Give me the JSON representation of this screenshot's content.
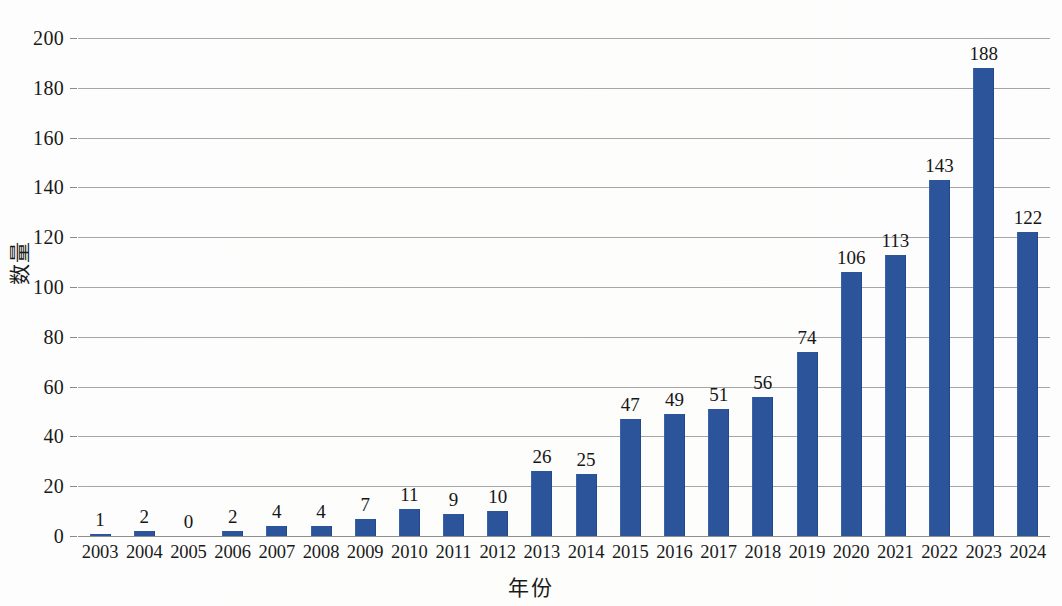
{
  "chart_data": {
    "type": "bar",
    "title": "",
    "xlabel": "年份",
    "ylabel": "数量",
    "categories": [
      "2003",
      "2004",
      "2005",
      "2006",
      "2007",
      "2008",
      "2009",
      "2010",
      "2011",
      "2012",
      "2013",
      "2014",
      "2015",
      "2016",
      "2017",
      "2018",
      "2019",
      "2020",
      "2021",
      "2022",
      "2023",
      "2024"
    ],
    "values": [
      1,
      2,
      0,
      2,
      4,
      4,
      7,
      11,
      9,
      10,
      26,
      25,
      47,
      49,
      51,
      56,
      74,
      106,
      113,
      143,
      188,
      122
    ],
    "data_labels": [
      "1",
      "2",
      "0",
      "2",
      "4",
      "4",
      "7",
      "11",
      "9",
      "10",
      "26",
      "25",
      "47",
      "49",
      "51",
      "56",
      "74",
      "106",
      "113",
      "143",
      "188",
      "122"
    ],
    "ylim": [
      0,
      200
    ],
    "ytick_values": [
      0,
      20,
      40,
      60,
      80,
      100,
      120,
      140,
      160,
      180,
      200
    ],
    "ytick_labels": [
      "0",
      "20",
      "40",
      "60",
      "80",
      "100",
      "120",
      "140",
      "160",
      "180",
      "200"
    ],
    "grid": true,
    "legend": false,
    "legend_position": "none",
    "series_color": "#2b549b",
    "gridline_color": "#a6a6a6",
    "background_color": "#fdfdfd"
  }
}
